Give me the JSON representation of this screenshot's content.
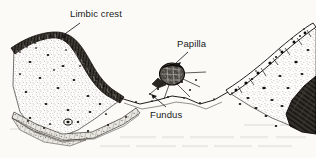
{
  "figure": {
    "background_color": "#fbfaf7",
    "ink_color": "#1a1a1a",
    "width": 316,
    "height": 158
  },
  "labels": [
    {
      "id": "limbic-crest",
      "text": "Limbic crest",
      "x": 70,
      "y": 9,
      "leader": "points down-left to the crest of the epithelial band"
    },
    {
      "id": "papilla",
      "text": "Papilla",
      "x": 177,
      "y": 39,
      "leader": "points down-left to the rounded papillary body"
    },
    {
      "id": "fundus",
      "text": "Fundus",
      "x": 150,
      "y": 110,
      "leader": "points up-left to the base of the sulcus"
    }
  ],
  "structures": [
    {
      "id": "limbic-crest-epithelium",
      "name": "Limbic crest epithelium",
      "description": "dark stratified cellular band capping the left elevation"
    },
    {
      "id": "left-connective-tissue",
      "name": "Left connective tissue",
      "description": "stippled fibrous core of the left mound"
    },
    {
      "id": "sulcus-wall",
      "name": "Sulcus wall",
      "description": "epithelial band descending from crest to fundus"
    },
    {
      "id": "fundus-junction",
      "name": "Fundus",
      "description": "base of the sulcus where epithelium meets the tissue"
    },
    {
      "id": "papilla-body",
      "name": "Papilla",
      "description": "densely hatched rounded papillary body above the junction"
    },
    {
      "id": "right-connective-tissue",
      "name": "Right connective tissue",
      "description": "stippled tissue of the right elevation"
    },
    {
      "id": "right-surface-cells",
      "name": "Right surface cell layer",
      "description": "row of large outlined polygonal cells with dark nuclei along the upper right slope"
    },
    {
      "id": "dark-wedge",
      "name": "Dark fibrous wedge",
      "description": "dense dark wedge mass at lower right"
    },
    {
      "id": "basal-band",
      "name": "Basal banded layer",
      "description": "thin banded layer along the lower left margin"
    }
  ],
  "icons": {
    "leader_line": "leader-line-icon"
  }
}
